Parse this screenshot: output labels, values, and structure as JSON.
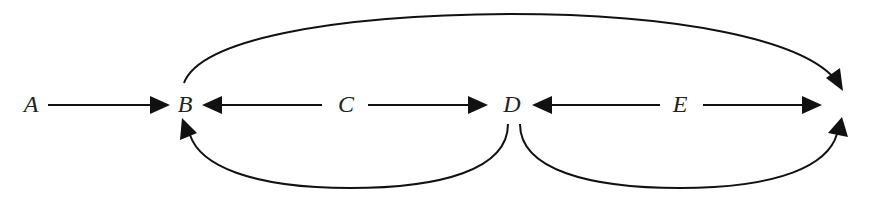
{
  "diagram": {
    "type": "directed-graph",
    "colors": {
      "line": "#111111",
      "text": "#222222",
      "background": "#ffffff"
    },
    "nodes": [
      {
        "id": "A",
        "label": "A",
        "x": 31,
        "y": 104
      },
      {
        "id": "B",
        "label": "B",
        "x": 185,
        "y": 104
      },
      {
        "id": "C",
        "label": "C",
        "x": 346,
        "y": 104
      },
      {
        "id": "D",
        "label": "D",
        "x": 512,
        "y": 104
      },
      {
        "id": "E",
        "label": "E",
        "x": 680,
        "y": 104
      },
      {
        "id": "F",
        "label": "",
        "x": 845,
        "y": 104
      }
    ],
    "edges": [
      {
        "from": "A",
        "to": "B",
        "style": "straight"
      },
      {
        "from": "C",
        "to": "B",
        "style": "straight"
      },
      {
        "from": "C",
        "to": "D",
        "style": "straight"
      },
      {
        "from": "E",
        "to": "D",
        "style": "straight"
      },
      {
        "from": "E",
        "to": "F",
        "style": "straight"
      },
      {
        "from": "B",
        "to": "F",
        "style": "arc-over"
      },
      {
        "from": "D",
        "to": "B",
        "style": "arc-under"
      },
      {
        "from": "D",
        "to": "F",
        "style": "arc-under"
      }
    ]
  }
}
